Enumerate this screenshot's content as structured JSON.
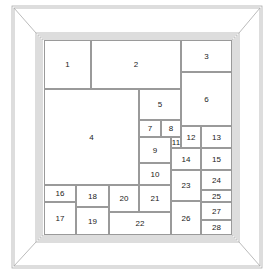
{
  "diagram": {
    "type": "framed panel layout",
    "colors": {
      "line": "#9a9a9a",
      "frame": "#aaaaaa",
      "text": "#222222"
    },
    "panels": [
      {
        "label": "1",
        "x": 44,
        "y": 40,
        "w": 47,
        "h": 49
      },
      {
        "label": "2",
        "x": 91,
        "y": 40,
        "w": 90,
        "h": 49
      },
      {
        "label": "3",
        "x": 181,
        "y": 40,
        "w": 51,
        "h": 32
      },
      {
        "label": "4",
        "x": 44,
        "y": 89,
        "w": 95,
        "h": 96
      },
      {
        "label": "5",
        "x": 139,
        "y": 89,
        "w": 42,
        "h": 31
      },
      {
        "label": "6",
        "x": 181,
        "y": 72,
        "w": 51,
        "h": 54
      },
      {
        "label": "7",
        "x": 139,
        "y": 120,
        "w": 22,
        "h": 17
      },
      {
        "label": "8",
        "x": 161,
        "y": 120,
        "w": 20,
        "h": 17
      },
      {
        "label": "9",
        "x": 139,
        "y": 137,
        "w": 32,
        "h": 26
      },
      {
        "label": "10",
        "x": 139,
        "y": 163,
        "w": 32,
        "h": 22
      },
      {
        "label": "11",
        "x": 171,
        "y": 137,
        "w": 10,
        "h": 11
      },
      {
        "label": "12",
        "x": 181,
        "y": 126,
        "w": 20,
        "h": 22
      },
      {
        "label": "13",
        "x": 201,
        "y": 126,
        "w": 31,
        "h": 22
      },
      {
        "label": "14",
        "x": 171,
        "y": 148,
        "w": 30,
        "h": 22
      },
      {
        "label": "15",
        "x": 201,
        "y": 148,
        "w": 31,
        "h": 22
      },
      {
        "label": "16",
        "x": 44,
        "y": 185,
        "w": 32,
        "h": 17
      },
      {
        "label": "17",
        "x": 44,
        "y": 202,
        "w": 32,
        "h": 33
      },
      {
        "label": "18",
        "x": 76,
        "y": 185,
        "w": 33,
        "h": 22
      },
      {
        "label": "19",
        "x": 76,
        "y": 207,
        "w": 33,
        "h": 28
      },
      {
        "label": "20",
        "x": 109,
        "y": 185,
        "w": 30,
        "h": 27
      },
      {
        "label": "21",
        "x": 139,
        "y": 185,
        "w": 32,
        "h": 27
      },
      {
        "label": "22",
        "x": 109,
        "y": 212,
        "w": 62,
        "h": 23
      },
      {
        "label": "23",
        "x": 171,
        "y": 170,
        "w": 30,
        "h": 31
      },
      {
        "label": "24",
        "x": 201,
        "y": 170,
        "w": 31,
        "h": 20
      },
      {
        "label": "25",
        "x": 201,
        "y": 190,
        "w": 31,
        "h": 12
      },
      {
        "label": "26",
        "x": 171,
        "y": 201,
        "w": 30,
        "h": 34
      },
      {
        "label": "27",
        "x": 201,
        "y": 202,
        "w": 31,
        "h": 18
      },
      {
        "label": "28",
        "x": 201,
        "y": 220,
        "w": 31,
        "h": 15
      }
    ]
  }
}
